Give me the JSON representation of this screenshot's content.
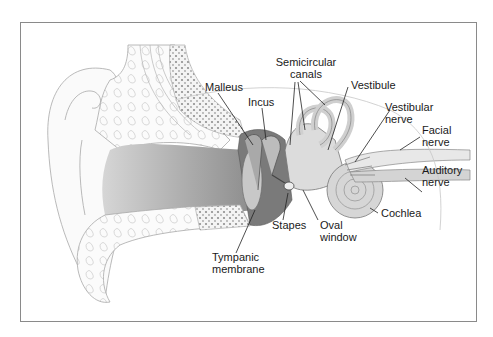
{
  "figure": {
    "labels": {
      "semicircular_canals": [
        "Semicircular",
        "canals"
      ],
      "malleus": "Malleus",
      "incus": "Incus",
      "vestibule": "Vestibule",
      "vestibular_nerve": [
        "Vestibular",
        "nerve"
      ],
      "facial_nerve": [
        "Facial",
        "nerve"
      ],
      "auditory_nerve": [
        "Auditory",
        "nerve"
      ],
      "cochlea": "Cochlea",
      "stapes": "Stapes",
      "oval_window": [
        "Oval",
        "window"
      ],
      "tympanic_membrane": [
        "Tympanic",
        "membrane"
      ]
    },
    "colors": {
      "frame": "#8a8a8a",
      "outline": "#9a9a9a",
      "canal_gray": "#b8b8b8",
      "ossicle_dark": "#6e6e6e",
      "inner_ear": "#d9d9d9",
      "leader_line": "#222222"
    }
  }
}
